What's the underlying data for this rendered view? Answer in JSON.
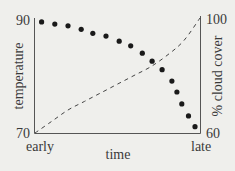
{
  "chart_data": {
    "type": "scatter",
    "title": "",
    "xlabel": "time",
    "ylabel": "temperature",
    "y2label": "% cloud cover",
    "x_tick_labels": [
      "early",
      "late"
    ],
    "y_ticks": [
      "90",
      "70"
    ],
    "y2_ticks": [
      "100",
      "60"
    ],
    "ylim": [
      70,
      90
    ],
    "y2lim": [
      60,
      100
    ],
    "grid": false,
    "legend": null,
    "series": [
      {
        "name": "temperature",
        "axis": "left",
        "style": "dots",
        "x": [
          0.04,
          0.12,
          0.2,
          0.28,
          0.35,
          0.43,
          0.51,
          0.58,
          0.65,
          0.71,
          0.77,
          0.83,
          0.86,
          0.89,
          0.93,
          0.97
        ],
        "values": [
          89.5,
          89.1,
          88.8,
          88.2,
          87.5,
          87.0,
          86.1,
          85.3,
          84.0,
          82.6,
          81.1,
          79.1,
          77.2,
          75.1,
          73.0,
          71.1
        ]
      },
      {
        "name": "% cloud cover",
        "axis": "right",
        "style": "dashed",
        "x": [
          0.0,
          0.1,
          0.2,
          0.3,
          0.4,
          0.5,
          0.6,
          0.7,
          0.8,
          0.9,
          1.0
        ],
        "values": [
          60,
          64,
          68,
          71,
          74,
          77,
          80,
          83,
          87,
          92,
          100
        ]
      }
    ]
  },
  "labels": {
    "y_top": "90",
    "y_bottom": "70",
    "y2_top": "100",
    "y2_bottom": "60",
    "x_left": "early",
    "x_right": "late",
    "x_title": "time",
    "y_title": "temperature",
    "y2_title": "% cloud cover"
  }
}
